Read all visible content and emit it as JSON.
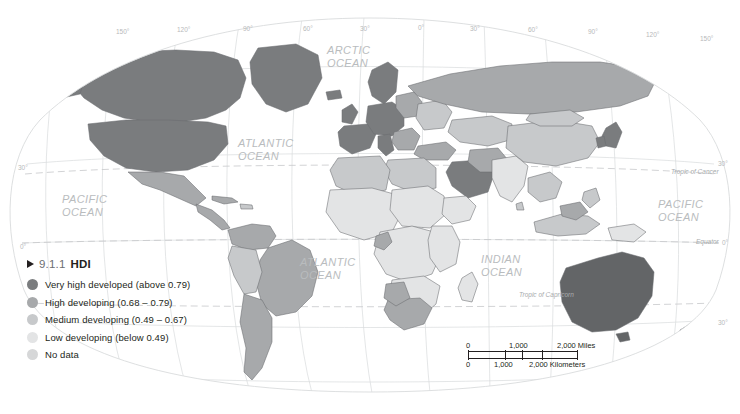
{
  "header": {
    "left_caption": "",
    "right_caption": ""
  },
  "legend": {
    "marker": "triangle-right",
    "number": "9.1.1",
    "title": "HDI",
    "items": [
      {
        "label": "Very high developed (above 0.79)",
        "color": "#7a7c7e",
        "key": "very-high-developed"
      },
      {
        "label": "High developing (0.68 – 0.79)",
        "color": "#a7a9ab",
        "key": "high-developing"
      },
      {
        "label": "Medium developing (0.49 – 0.67)",
        "color": "#c7c9cb",
        "key": "medium-developing"
      },
      {
        "label": "Low developing (below 0.49)",
        "color": "#e3e4e5",
        "key": "low-developing"
      },
      {
        "label": "No data",
        "color": "#d6d7d8",
        "key": "no-data"
      }
    ]
  },
  "scale_bar": {
    "miles": {
      "zero": "0",
      "mid": "1,000",
      "end": "2,000 Miles"
    },
    "kilometers": {
      "zero": "0",
      "mid": "1,000",
      "end": "2,000 Kilometers"
    }
  },
  "ocean_labels": [
    {
      "name": "arctic-ocean",
      "text": "ARCTIC\nOCEAN",
      "x": 327,
      "y": 44
    },
    {
      "name": "pacific-ocean-west",
      "text": "PACIFIC\nOCEAN",
      "x": 62,
      "y": 193
    },
    {
      "name": "atlantic-ocean-north",
      "text": "ATLANTIC\nOCEAN",
      "x": 238,
      "y": 137
    },
    {
      "name": "atlantic-ocean-south",
      "text": "ATLANTIC\nOCEAN",
      "x": 300,
      "y": 256
    },
    {
      "name": "indian-ocean",
      "text": "INDIAN\nOCEAN",
      "x": 481,
      "y": 253
    },
    {
      "name": "pacific-ocean-east",
      "text": "PACIFIC\nOCEAN",
      "x": 658,
      "y": 198
    }
  ],
  "latitude_labels": [
    {
      "value": "30°",
      "side": "left",
      "x": 18,
      "y": 164
    },
    {
      "value": "0°",
      "side": "left",
      "x": 20,
      "y": 243
    },
    {
      "value": "30°",
      "side": "right",
      "x": 718,
      "y": 160
    },
    {
      "value": "0°",
      "side": "right",
      "x": 722,
      "y": 239
    },
    {
      "value": "30°",
      "side": "right",
      "x": 718,
      "y": 319
    }
  ],
  "longitude_labels": [
    {
      "value": "150°",
      "x": 116,
      "y": 28
    },
    {
      "value": "120°",
      "x": 177,
      "y": 26
    },
    {
      "value": "90°",
      "x": 243,
      "y": 25
    },
    {
      "value": "60°",
      "x": 303,
      "y": 25
    },
    {
      "value": "30°",
      "x": 360,
      "y": 25
    },
    {
      "value": "0°",
      "x": 418,
      "y": 24
    },
    {
      "value": "30°",
      "x": 470,
      "y": 25
    },
    {
      "value": "60°",
      "x": 528,
      "y": 26
    },
    {
      "value": "90°",
      "x": 588,
      "y": 28
    },
    {
      "value": "120°",
      "x": 646,
      "y": 31
    },
    {
      "value": "150°",
      "x": 700,
      "y": 35
    }
  ],
  "special_lines": [
    {
      "name": "tropic-of-cancer",
      "text": "Tropic of Cancer",
      "x": 671,
      "y": 168
    },
    {
      "name": "equator",
      "text": "Equator",
      "x": 696,
      "y": 238
    },
    {
      "name": "tropic-of-capricorn",
      "text": "Tropic of Capricorn",
      "x": 519,
      "y": 291
    }
  ],
  "colors": {
    "very_high": "#7a7c7e",
    "high": "#a7a9ab",
    "medium": "#c7c9cb",
    "low": "#e3e4e5",
    "no_data": "#d6d7d8",
    "graticule": "#d4d6d8",
    "coastline": "#6f7174",
    "border": "#58595b",
    "background": "#ffffff"
  }
}
